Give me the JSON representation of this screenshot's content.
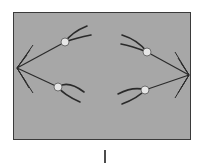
{
  "diagram": {
    "type": "cell-division-anaphase",
    "label": "",
    "colors": {
      "cell_fill": "#a7a7a7",
      "cell_border": "#3a3a3a",
      "line": "#2a2a2a",
      "centromere": "#e6e6e6",
      "background": "#ffffff"
    },
    "poles": [
      {
        "id": "left-pole",
        "x": 17,
        "y": 68
      },
      {
        "id": "right-pole",
        "x": 189,
        "y": 75
      }
    ],
    "chromosomes": [
      {
        "id": "chromosome-upper-left",
        "x": 65,
        "y": 42
      },
      {
        "id": "chromosome-lower-left",
        "x": 58,
        "y": 87
      },
      {
        "id": "chromosome-upper-right",
        "x": 147,
        "y": 52
      },
      {
        "id": "chromosome-lower-right",
        "x": 145,
        "y": 90
      }
    ]
  }
}
